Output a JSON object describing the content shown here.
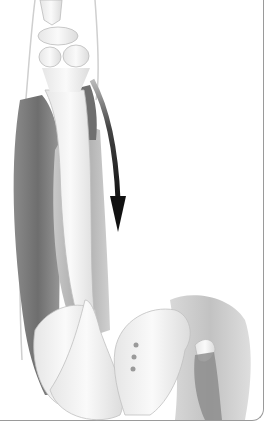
{
  "illustration": {
    "subject": "anatomical illustration of leg muscles and pelvis",
    "elements": [
      "knee-joint",
      "femur",
      "thigh-muscles",
      "curved-arrow",
      "pelvis",
      "sacrum",
      "hip-joint"
    ],
    "arrow_direction": "down",
    "colors": {
      "background": "#ffffff",
      "bone": "#f2f2f2",
      "muscle_dark": "#7a7a7a",
      "muscle_mid": "#b0b0b0",
      "muscle_light": "#d8d8d8",
      "arrow": "#1a1a1a",
      "frame": "#9a9a9a"
    }
  }
}
